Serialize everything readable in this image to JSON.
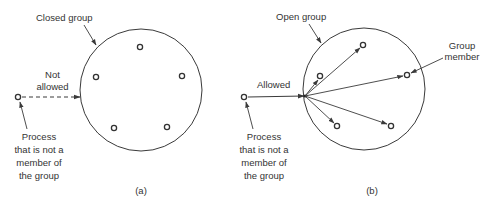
{
  "figure": {
    "panel_a": {
      "caption": "(a)",
      "group_label": "Closed group",
      "edge_label_line1": "Not",
      "edge_label_line2": "allowed",
      "outsider_label": [
        "Process",
        "that is not a",
        "member of",
        "the group"
      ],
      "member_count": 5,
      "edge_style": "dashed"
    },
    "panel_b": {
      "caption": "(b)",
      "group_label": "Open group",
      "edge_label": "Allowed",
      "member_label_line1": "Group",
      "member_label_line2": "member",
      "outsider_label": [
        "Process",
        "that is not a",
        "member of",
        "the group"
      ],
      "member_count": 5,
      "edge_style": "solid"
    },
    "colors": {
      "stroke": "#3a3a3a",
      "text": "#333333",
      "background": "#ffffff"
    }
  }
}
